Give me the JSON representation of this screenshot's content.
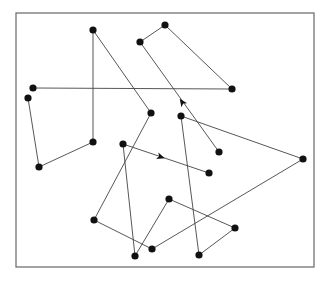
{
  "diagram": {
    "type": "graph-path",
    "frame": {
      "x1": 16,
      "y1": 13,
      "x2": 314,
      "y2": 267,
      "color": "#666666"
    },
    "line_color": "#444444",
    "node_color": "#111111",
    "node_radius": 3.6,
    "nodes": [
      {
        "id": "n1",
        "x": 28,
        "y": 98
      },
      {
        "id": "n2",
        "x": 39,
        "y": 167
      },
      {
        "id": "n3",
        "x": 93,
        "y": 142
      },
      {
        "id": "n4",
        "x": 93,
        "y": 30
      },
      {
        "id": "n5",
        "x": 151,
        "y": 113
      },
      {
        "id": "n6",
        "x": 94,
        "y": 220
      },
      {
        "id": "n7",
        "x": 152,
        "y": 249
      },
      {
        "id": "n8",
        "x": 303,
        "y": 159
      },
      {
        "id": "n9",
        "x": 181,
        "y": 116
      },
      {
        "id": "n10",
        "x": 199,
        "y": 255
      },
      {
        "id": "n11",
        "x": 235,
        "y": 228
      },
      {
        "id": "n12",
        "x": 169,
        "y": 199
      },
      {
        "id": "n13",
        "x": 135,
        "y": 256
      },
      {
        "id": "n14",
        "x": 123,
        "y": 144
      },
      {
        "id": "n15",
        "x": 209,
        "y": 173
      },
      {
        "id": "n16",
        "x": 33,
        "y": 88
      },
      {
        "id": "n17",
        "x": 232,
        "y": 89
      },
      {
        "id": "n18",
        "x": 165,
        "y": 25
      },
      {
        "id": "n19",
        "x": 140,
        "y": 42
      },
      {
        "id": "n20",
        "x": 219,
        "y": 152
      }
    ],
    "edges": [
      {
        "from": "n1",
        "to": "n2"
      },
      {
        "from": "n2",
        "to": "n3"
      },
      {
        "from": "n3",
        "to": "n4"
      },
      {
        "from": "n4",
        "to": "n5"
      },
      {
        "from": "n5",
        "to": "n6"
      },
      {
        "from": "n6",
        "to": "n7"
      },
      {
        "from": "n7",
        "to": "n8"
      },
      {
        "from": "n8",
        "to": "n9"
      },
      {
        "from": "n9",
        "to": "n10"
      },
      {
        "from": "n10",
        "to": "n11"
      },
      {
        "from": "n11",
        "to": "n12"
      },
      {
        "from": "n12",
        "to": "n13"
      },
      {
        "from": "n13",
        "to": "n14"
      },
      {
        "from": "n14",
        "to": "n15",
        "arrow": {
          "x": 161,
          "y": 157
        }
      },
      {
        "from": "n16",
        "to": "n17"
      },
      {
        "from": "n17",
        "to": "n18"
      },
      {
        "from": "n18",
        "to": "n19"
      },
      {
        "from": "n20",
        "to": "n19",
        "arrow": {
          "x": 182,
          "y": 102
        }
      }
    ]
  }
}
